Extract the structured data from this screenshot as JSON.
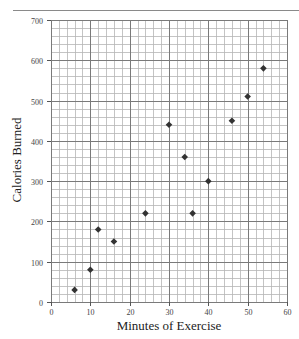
{
  "chart_data": {
    "type": "scatter",
    "title": "",
    "xlabel": "Minutes of Exercise",
    "ylabel": "Calories Burned",
    "xlim": [
      0,
      60
    ],
    "ylim": [
      0,
      700
    ],
    "x_ticks": [
      0,
      10,
      20,
      30,
      40,
      50,
      60
    ],
    "y_ticks": [
      0,
      100,
      200,
      300,
      400,
      500,
      600,
      700
    ],
    "x_minor_step": 2,
    "y_minor_step": 20,
    "grid": true,
    "legend": null,
    "marker": "diamond",
    "marker_color": "#333333",
    "series": [
      {
        "name": "Calories vs Minutes",
        "points": [
          {
            "x": 6,
            "y": 30
          },
          {
            "x": 10,
            "y": 80
          },
          {
            "x": 12,
            "y": 180
          },
          {
            "x": 16,
            "y": 150
          },
          {
            "x": 24,
            "y": 220
          },
          {
            "x": 30,
            "y": 440
          },
          {
            "x": 34,
            "y": 360
          },
          {
            "x": 36,
            "y": 220
          },
          {
            "x": 40,
            "y": 300
          },
          {
            "x": 46,
            "y": 450
          },
          {
            "x": 50,
            "y": 510
          },
          {
            "x": 54,
            "y": 580
          }
        ]
      }
    ]
  },
  "colors": {
    "minor_grid": "#b5b5b5",
    "major_grid": "#7a7a7a",
    "axis": "#555555",
    "tick_label": "#444444",
    "marker": "#333333"
  }
}
